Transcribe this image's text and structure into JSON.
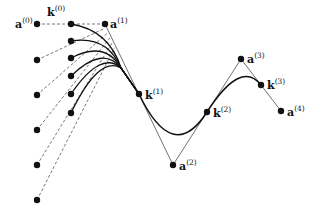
{
  "figure": {
    "type": "spline-control-polygon-diagram",
    "colors": {
      "ink": "#111111",
      "thin": "#333333",
      "dashed": "#555555",
      "background": "#ffffff"
    },
    "control_points": [
      {
        "name": "a",
        "index": "0",
        "x": 37,
        "y": 24,
        "label_dx": -22,
        "label_dy": 4
      },
      {
        "name": "a",
        "index": "1",
        "x": 105,
        "y": 24,
        "label_dx": 5,
        "label_dy": 4
      },
      {
        "name": "a",
        "index": "2",
        "x": 173,
        "y": 165,
        "label_dx": 6,
        "label_dy": 5
      },
      {
        "name": "a",
        "index": "3",
        "x": 241,
        "y": 59,
        "label_dx": 6,
        "label_dy": 4
      },
      {
        "name": "a",
        "index": "4",
        "x": 281,
        "y": 111,
        "label_dx": 6,
        "label_dy": 5
      }
    ],
    "knots": [
      {
        "name": "k",
        "index": "0",
        "x": 71,
        "y": 24,
        "label_dx": -24,
        "label_dy": -8
      },
      {
        "name": "k",
        "index": "1",
        "x": 139,
        "y": 94,
        "label_dx": 6,
        "label_dy": 5
      },
      {
        "name": "k",
        "index": "2",
        "x": 207,
        "y": 112,
        "label_dx": 6,
        "label_dy": 5
      },
      {
        "name": "k",
        "index": "3",
        "x": 261,
        "y": 85,
        "label_dx": 6,
        "label_dy": 4
      }
    ],
    "variant_knots": [
      {
        "x": 71,
        "y": 41
      },
      {
        "x": 71,
        "y": 58
      },
      {
        "x": 71,
        "y": 76
      },
      {
        "x": 71,
        "y": 94
      },
      {
        "x": 71,
        "y": 113
      }
    ],
    "variant_controls": [
      {
        "x": 37,
        "y": 60
      },
      {
        "x": 37,
        "y": 95
      },
      {
        "x": 37,
        "y": 130
      },
      {
        "x": 37,
        "y": 165
      },
      {
        "x": 37,
        "y": 200
      }
    ]
  }
}
